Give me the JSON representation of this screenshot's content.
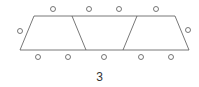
{
  "diagram": {
    "label": "3",
    "colors": {
      "stroke": "#555555",
      "background": "#ffffff"
    },
    "outline": {
      "tl": [
        34,
        16
      ],
      "tr": [
        175,
        16
      ],
      "br": [
        189,
        50
      ],
      "bl": [
        20,
        50
      ]
    },
    "dividers": [
      {
        "top": [
          72,
          16
        ],
        "bottom": [
          86,
          50
        ]
      },
      {
        "top": [
          137,
          16
        ],
        "bottom": [
          123,
          50
        ]
      }
    ],
    "circles": [
      [
        53,
        9
      ],
      [
        89,
        9
      ],
      [
        119,
        9
      ],
      [
        156,
        9
      ],
      [
        20,
        31
      ],
      [
        188,
        30
      ],
      [
        38,
        57
      ],
      [
        68,
        57
      ],
      [
        104,
        57
      ],
      [
        141,
        57
      ],
      [
        171,
        57
      ]
    ]
  }
}
